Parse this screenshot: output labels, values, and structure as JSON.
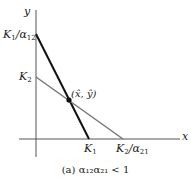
{
  "diagram": {
    "axes": {
      "x_label": "x",
      "y_label": "y",
      "origin": [
        36,
        139
      ]
    },
    "lines": [
      {
        "name": "species-1-isocline",
        "color": "#111111",
        "width": 2,
        "from_label": "K1/α12",
        "to_label": "K1",
        "from": [
          36,
          34
        ],
        "to": [
          89,
          139
        ]
      },
      {
        "name": "species-2-isocline",
        "color": "#777777",
        "width": 1.5,
        "from_label": "K2",
        "to_label": "K2/α21",
        "from": [
          36,
          77
        ],
        "to": [
          123,
          139
        ]
      }
    ],
    "equilibrium": {
      "label": "(x̂, ŷ)",
      "point": [
        69,
        100
      ]
    },
    "labels": {
      "k1_over_a12": {
        "base": "K",
        "sub1": "1",
        "sep": "/α",
        "sub2": "12"
      },
      "k2": {
        "base": "K",
        "sub1": "2"
      },
      "k1": {
        "base": "K",
        "sub1": "1"
      },
      "k2_over_a21": {
        "base": "K",
        "sub1": "2",
        "sep": "/α",
        "sub2": "21"
      },
      "equilibrium": "(x̂, ŷ)"
    },
    "caption": "(a) α₁₂α₂₁ < 1"
  }
}
